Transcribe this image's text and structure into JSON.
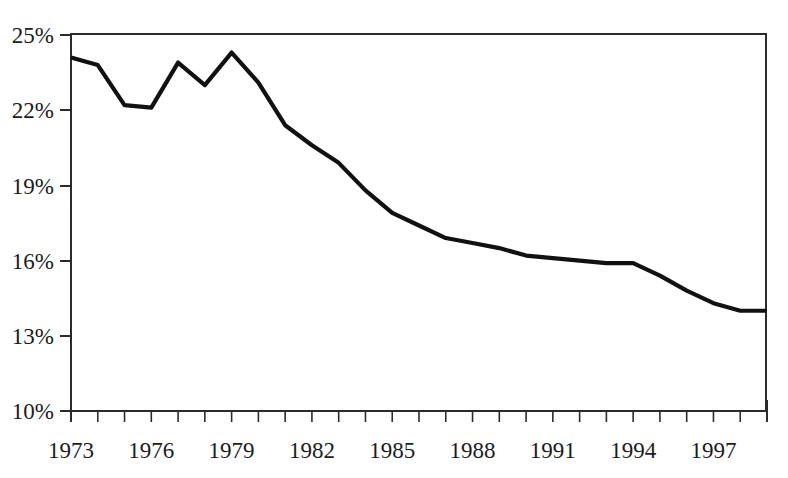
{
  "chart_data": {
    "type": "line",
    "title": "",
    "subtitle": "",
    "xlabel": "",
    "ylabel": "",
    "grid": false,
    "legend": "none",
    "xlim": [
      1973,
      1999
    ],
    "ylim": [
      10,
      25
    ],
    "y_tick_labels": [
      "25%",
      "22%",
      "19%",
      "16%",
      "13%",
      "10%"
    ],
    "y_tick_values": [
      25,
      22,
      19,
      16,
      13,
      10
    ],
    "x_tick_labels": [
      "1973",
      "1976",
      "1979",
      "1982",
      "1985",
      "1988",
      "1991",
      "1994",
      "1997"
    ],
    "x_tick_values": [
      1973,
      1976,
      1979,
      1982,
      1985,
      1988,
      1991,
      1994,
      1997
    ],
    "x_minor_ticks_every": 1,
    "series": [
      {
        "name": "series-1",
        "color": "#111111",
        "x": [
          1973,
          1974,
          1975,
          1976,
          1977,
          1978,
          1979,
          1980,
          1981,
          1982,
          1983,
          1984,
          1985,
          1986,
          1987,
          1988,
          1989,
          1990,
          1991,
          1992,
          1993,
          1994,
          1995,
          1996,
          1997,
          1998,
          1999
        ],
        "values": [
          24.1,
          23.8,
          22.2,
          22.1,
          23.9,
          23.0,
          24.3,
          23.1,
          21.4,
          20.6,
          19.9,
          18.8,
          17.9,
          17.4,
          16.9,
          16.7,
          16.5,
          16.2,
          16.1,
          16.0,
          15.9,
          15.9,
          15.4,
          14.8,
          14.3,
          14.0,
          14.0
        ]
      }
    ]
  },
  "axes": {
    "y_axis_name": "percent-axis",
    "x_axis_name": "year-axis"
  }
}
